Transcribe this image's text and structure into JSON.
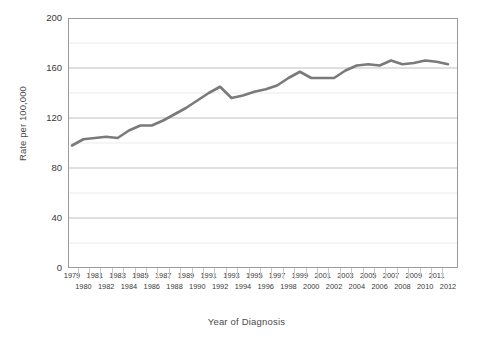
{
  "chart_data": {
    "type": "line",
    "title": "",
    "xlabel": "Year of Diagnosis",
    "ylabel": "Rate per 100,000",
    "ylim": [
      0,
      200
    ],
    "ytick_labels": [
      "0",
      "40",
      "80",
      "120",
      "160",
      "200"
    ],
    "yticks": [
      0,
      40,
      80,
      120,
      160,
      200
    ],
    "gridline_values": [
      20,
      40,
      60,
      80,
      100,
      120,
      140,
      160,
      180,
      200
    ],
    "grid": true,
    "legend": "none",
    "x": [
      1979,
      1980,
      1981,
      1982,
      1983,
      1984,
      1985,
      1986,
      1987,
      1988,
      1989,
      1990,
      1991,
      1992,
      1993,
      1994,
      1995,
      1996,
      1997,
      1998,
      1999,
      2000,
      2001,
      2002,
      2003,
      2004,
      2005,
      2006,
      2007,
      2008,
      2009,
      2010,
      2011,
      2012
    ],
    "x_tick_labels_top": [
      "1979",
      "1981",
      "1983",
      "1985",
      "1987",
      "1989",
      "1991",
      "1993",
      "1995",
      "1997",
      "1999",
      "2001",
      "2003",
      "2005",
      "2007",
      "2009",
      "2011"
    ],
    "x_tick_labels_bottom": [
      "1980",
      "1982",
      "1984",
      "1986",
      "1988",
      "1990",
      "1992",
      "1994",
      "1996",
      "1998",
      "2000",
      "2002",
      "2004",
      "2006",
      "2008",
      "2010",
      "2012"
    ],
    "series": [
      {
        "name": "Rate per 100,000",
        "color": "#7a7a7a",
        "values": [
          98,
          103,
          104,
          105,
          104,
          110,
          114,
          114,
          118,
          123,
          128,
          134,
          140,
          145,
          136,
          138,
          141,
          143,
          146,
          152,
          157,
          152,
          152,
          152,
          158,
          162,
          163,
          162,
          166,
          163,
          164,
          166,
          165,
          163
        ]
      }
    ]
  }
}
